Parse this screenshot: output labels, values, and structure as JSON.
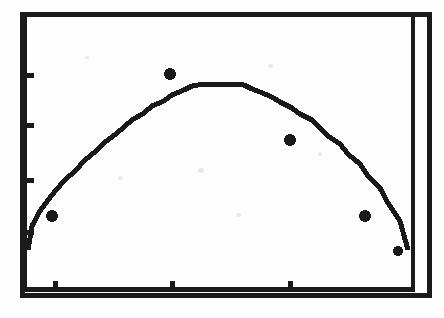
{
  "figure": {
    "kind": "scanned-scatter-with-fitted-curve",
    "title": "",
    "subtitle": "",
    "background_color": "#fdfdfd",
    "ink_color": "#1a1a1a",
    "frame": {
      "outer_border_visible": true,
      "inner_right_rule_visible": true,
      "left_px": 22,
      "top_px": 14,
      "right_px": 414,
      "bottom_px": 296,
      "outer_right_px": 432,
      "line_width_px": 4
    },
    "axes": {
      "x_ticks_px": [
        55,
        172,
        290
      ],
      "y_ticks_px": [
        75,
        125,
        180,
        232
      ],
      "tick_length_px": 7,
      "tick_side_x": "inside-top",
      "tick_side_y": "inside-right",
      "x_tick_labels": [],
      "y_tick_labels": [],
      "xlabel": "",
      "ylabel": "",
      "grid": false,
      "legend": false
    }
  },
  "chart_data": {
    "type": "scatter",
    "title": "",
    "subtitle": "",
    "xlabel": "",
    "ylabel": "",
    "grid": false,
    "legend_position": "none",
    "xlim": [
      0,
      1
    ],
    "ylim": [
      0,
      1
    ],
    "x_tick_positions": [
      0.085,
      0.383,
      0.684
    ],
    "y_tick_positions": [
      0.784,
      0.607,
      0.412,
      0.227
    ],
    "x_tick_labels": [],
    "y_tick_labels": [],
    "series": [
      {
        "name": "fitted curve",
        "type": "line",
        "style": "pixelated-staircase",
        "color": "#1a1a1a",
        "line_width_px": 5,
        "x": [
          0.0,
          0.02,
          0.041,
          0.061,
          0.082,
          0.102,
          0.128,
          0.153,
          0.179,
          0.204,
          0.23,
          0.255,
          0.281,
          0.306,
          0.332,
          0.357,
          0.383,
          0.41,
          0.436,
          0.462,
          0.487,
          0.513,
          0.538,
          0.564,
          0.589,
          0.615,
          0.64,
          0.666,
          0.691,
          0.717,
          0.742,
          0.768,
          0.793,
          0.819,
          0.844,
          0.87,
          0.895,
          0.921,
          0.946,
          0.972,
          0.995
        ],
        "y": [
          0.16,
          0.248,
          0.301,
          0.34,
          0.376,
          0.408,
          0.447,
          0.482,
          0.515,
          0.546,
          0.576,
          0.603,
          0.629,
          0.653,
          0.676,
          0.697,
          0.716,
          0.734,
          0.748,
          0.755,
          0.757,
          0.757,
          0.757,
          0.751,
          0.74,
          0.726,
          0.71,
          0.692,
          0.672,
          0.65,
          0.626,
          0.6,
          0.571,
          0.54,
          0.506,
          0.469,
          0.428,
          0.383,
          0.331,
          0.267,
          0.16
        ]
      },
      {
        "name": "observations",
        "type": "scatter",
        "marker": "filled-circle",
        "color": "#1a1a1a",
        "points": [
          {
            "x": 0.077,
            "y": 0.287,
            "px": 52,
            "py": 216,
            "r_px": 6
          },
          {
            "x": 0.378,
            "y": 0.787,
            "px": 170,
            "py": 74,
            "r_px": 6
          },
          {
            "x": 0.684,
            "y": 0.553,
            "px": 290,
            "py": 140,
            "r_px": 6
          },
          {
            "x": 0.875,
            "y": 0.287,
            "px": 365,
            "py": 216,
            "r_px": 6
          },
          {
            "x": 0.959,
            "y": 0.163,
            "px": 398,
            "py": 251,
            "r_px": 5
          }
        ]
      }
    ]
  },
  "curve_path_px": "M 26,250 L 30,242 34,233 38,227 42,221 46,215 50,210 54,205 58,201 62,196 66,192 70,188 74,184 78,180 82,176 86,172 90,169 94,166 98,162 102,159 106,156 110,153 114,150 118,147 122,144 126,141 130,138 134,136 138,133 142,131 146,128 150,126 154,124 158,121 162,119 166,117 170,115 174,113 178,111 182,109 186,107 190,106 194,105 198,104 202,103 206,103 210,103 214,103 218,103 222,103 226,104 230,105 234,106 238,107 242,109 246,111 250,113 254,115 258,117 262,119 266,122 270,124 274,127 278,130 282,133 286,136 290,139 294,142 298,146 302,149 306,153 310,157 314,161 318,165 322,169 326,173 330,178 334,183 338,188 342,193 346,198 350,203 354,209 358,214 362,220 366,226 370,232 374,238 378,245 382,251 386,258 390,265 394,272 398,279 402,286 406,292 409,295"
}
